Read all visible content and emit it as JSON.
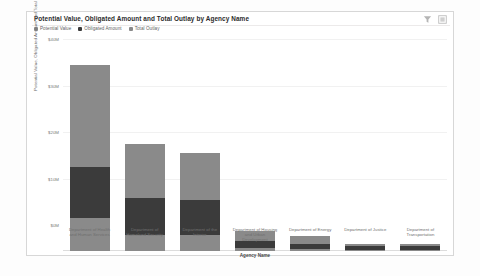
{
  "card": {
    "title": "Potential Value, Obligated Amount and Total Outlay by Agency Name",
    "filter_icon": "filter-funnel-icon",
    "focus_icon": "focus-mode-icon"
  },
  "legend": {
    "position": "top-left",
    "items": [
      {
        "label": "Potential Value",
        "color": "#8a8a8a"
      },
      {
        "label": "Obligated Amount",
        "color": "#3b3b3b"
      },
      {
        "label": "Total Outlay",
        "color": "#8a8a8a"
      }
    ]
  },
  "chart_data": {
    "type": "bar",
    "title": "Potential Value, Obligated Amount and Total Outlay by Agency Name",
    "xlabel": "Agency Name",
    "ylabel": "Potential Value, Obligated Amount and Total Outlay",
    "stacked": true,
    "grid": true,
    "ylim": [
      0,
      40
    ],
    "yticks": [
      "$0M",
      "$10M",
      "$20M",
      "$30M",
      "$40M"
    ],
    "ytick_values": [
      0,
      10,
      20,
      30,
      40
    ],
    "categories": [
      "Department of Health and Human Services",
      "Department of Homeland Security",
      "Department of the Interior",
      "Department of Housing and Urban Development",
      "Department of Energy",
      "Department of Justice",
      "Department of Transportation"
    ],
    "series": [
      {
        "name": "Potential Value",
        "color": "#8a8a8a",
        "values": [
          22.0,
          11.5,
          10.0,
          2.2,
          1.7,
          0.5,
          0.5
        ]
      },
      {
        "name": "Obligated Amount",
        "color": "#3b3b3b",
        "values": [
          11.0,
          8.0,
          7.5,
          1.4,
          1.0,
          0.9,
          0.8
        ]
      },
      {
        "name": "Total Outlay",
        "color": "#8a8a8a",
        "values": [
          7.0,
          3.5,
          3.5,
          0.7,
          0.5,
          0.2,
          0.2
        ]
      }
    ],
    "totals": [
      40.0,
      23.0,
      21.0,
      4.3,
      3.2,
      1.6,
      1.5
    ]
  }
}
